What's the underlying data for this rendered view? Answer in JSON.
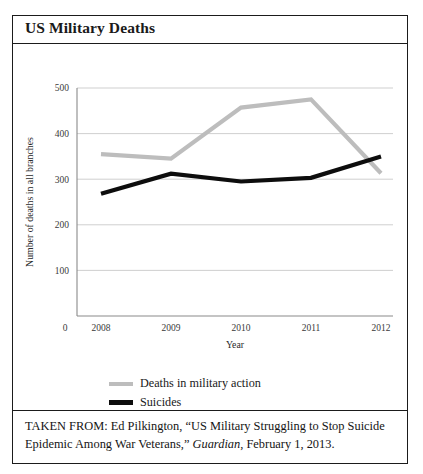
{
  "figure": {
    "title": "US Military Deaths",
    "caption": {
      "prefix": "TAKEN FROM: Ed Pilkington, “US Military Struggling to Stop Suicide Epidemic Among War Veterans,” ",
      "publication": "Guardian",
      "suffix": ", February 1, 2013."
    }
  },
  "legend": {
    "position": "below-plot",
    "items": [
      {
        "label": "Deaths in military action",
        "color": "#bdbdbd"
      },
      {
        "label": "Suicides",
        "color": "#0d0d0d"
      }
    ]
  },
  "chart_data": {
    "type": "line",
    "title": "US Military Deaths",
    "xlabel": "Year",
    "ylabel": "Number of deaths in all branches",
    "categories": [
      "2008",
      "2009",
      "2010",
      "2011",
      "2012"
    ],
    "x_origin_label": "0",
    "ylim": [
      0,
      500
    ],
    "yticks": [
      0,
      100,
      200,
      300,
      400,
      500
    ],
    "ytick_labels": [
      "0",
      "100",
      "200",
      "300",
      "400",
      "500"
    ],
    "grid": true,
    "grid_axis": "y",
    "series": [
      {
        "name": "Deaths in military action",
        "color": "#bdbdbd",
        "line_width": 4.2,
        "values": [
          355,
          345,
          457,
          475,
          313
        ]
      },
      {
        "name": "Suicides",
        "color": "#0d0d0d",
        "line_width": 4.2,
        "values": [
          268,
          312,
          295,
          303,
          350
        ]
      }
    ]
  }
}
